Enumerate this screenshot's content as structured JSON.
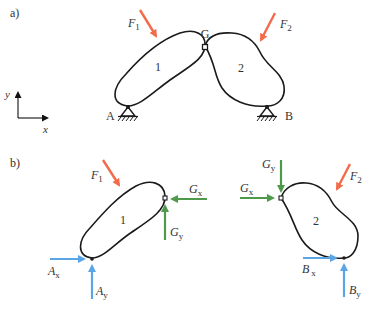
{
  "figure": {
    "part_a": {
      "label": "a)",
      "force_F1": {
        "symbol": "F",
        "sub": "1"
      },
      "force_F2": {
        "symbol": "F",
        "sub": "2"
      },
      "hinge_G": "G",
      "body_1": "1",
      "body_2": "2",
      "support_A": "A",
      "support_B": "B",
      "axis_y": "y",
      "axis_x": "x"
    },
    "part_b": {
      "label": "b)",
      "left": {
        "force_F1": {
          "symbol": "F",
          "sub": "1"
        },
        "Gx": {
          "symbol": "G",
          "sub": "x"
        },
        "Gy": {
          "symbol": "G",
          "sub": "y"
        },
        "Ax": {
          "symbol": "A",
          "sub": "x"
        },
        "Ay": {
          "symbol": "A",
          "sub": "y"
        },
        "body": "1"
      },
      "right": {
        "force_F2": {
          "symbol": "F",
          "sub": "2"
        },
        "Gx": {
          "symbol": "G",
          "sub": "x"
        },
        "Gy": {
          "symbol": "G",
          "sub": "y"
        },
        "Bx": {
          "symbol": "B",
          "sub": "x"
        },
        "By": {
          "symbol": "B",
          "sub": "y"
        },
        "body": "2"
      }
    },
    "colors": {
      "applied_force": "#f26b4a",
      "hinge_force": "#4f9a4a",
      "support_force": "#5aa5e6",
      "outline": "#1a1a1a"
    }
  }
}
